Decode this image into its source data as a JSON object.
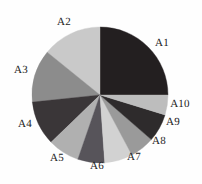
{
  "chart_data": {
    "type": "pie",
    "title": "",
    "subtitle": "",
    "xlabel": "",
    "ylabel": "",
    "legend_position": "none",
    "grid": false,
    "start_angle_deg": 0,
    "direction": "clockwise",
    "center": {
      "x": 100,
      "y": 95
    },
    "radius": 68,
    "categories": [
      "A1",
      "A2",
      "A3",
      "A4",
      "A5",
      "A6",
      "A7",
      "A8",
      "A9",
      "A10"
    ],
    "values": [
      25,
      14,
      12.5,
      10.5,
      7.5,
      6.5,
      6.5,
      6,
      6.5,
      5
    ],
    "total": 100,
    "slices": [
      {
        "label": "A1",
        "value": 25,
        "start_deg": 0,
        "end_deg": 90,
        "color": "#231f20",
        "label_x": 162,
        "label_y": 43
      },
      {
        "label": "A2",
        "value": 14,
        "start_deg": 309,
        "end_deg": 360,
        "color": "#c9c9c9",
        "label_x": 64,
        "label_y": 22
      },
      {
        "label": "A3",
        "value": 12.5,
        "start_deg": 264,
        "end_deg": 309,
        "color": "#8c8c8c",
        "label_x": 21,
        "label_y": 70
      },
      {
        "label": "A4",
        "value": 10.5,
        "start_deg": 226,
        "end_deg": 264,
        "color": "#3a3638",
        "label_x": 25,
        "label_y": 124
      },
      {
        "label": "A5",
        "value": 7.5,
        "start_deg": 199,
        "end_deg": 226,
        "color": "#b0b0b0",
        "label_x": 57,
        "label_y": 158
      },
      {
        "label": "A6",
        "value": 6.5,
        "start_deg": 176,
        "end_deg": 199,
        "color": "#57545a",
        "label_x": 97,
        "label_y": 166
      },
      {
        "label": "A7",
        "value": 6.5,
        "start_deg": 152,
        "end_deg": 176,
        "color": "#d2d2d2",
        "label_x": 134,
        "label_y": 157
      },
      {
        "label": "A8",
        "value": 6,
        "start_deg": 131,
        "end_deg": 152,
        "color": "#9a9a9a",
        "label_x": 159,
        "label_y": 141
      },
      {
        "label": "A9",
        "value": 6.5,
        "start_deg": 107,
        "end_deg": 131,
        "color": "#2e2b2c",
        "label_x": 173,
        "label_y": 122
      },
      {
        "label": "A10",
        "value": 5,
        "start_deg": 90,
        "end_deg": 107,
        "color": "#bdbdbd",
        "label_x": 180,
        "label_y": 104
      }
    ]
  }
}
